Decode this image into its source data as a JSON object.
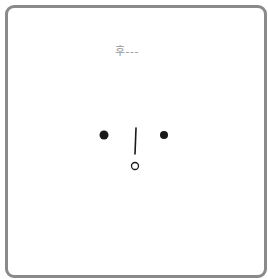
{
  "illustration": {
    "sigh_text": "후---",
    "colors": {
      "frame_border": "#8a8a8a",
      "sigh_text": "#9a9a9a",
      "features": "#1a1a1a",
      "background": "#ffffff"
    },
    "face": {
      "left_eye": {
        "cx": 104,
        "cy": 135,
        "r": 4.5
      },
      "right_eye": {
        "cx": 164,
        "cy": 135,
        "r": 4
      },
      "nose_line": {
        "x1": 136,
        "y1": 128,
        "x2": 135,
        "y2": 154
      },
      "mouth": {
        "cx": 135,
        "cy": 166,
        "r": 3.5
      }
    }
  }
}
